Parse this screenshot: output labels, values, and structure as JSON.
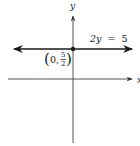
{
  "figure": {
    "type": "coordinate-graph",
    "axes": {
      "x_label": "x",
      "y_label": "y",
      "axis_color": "#555555"
    },
    "line": {
      "equation": "2y = 5",
      "equation_parts": {
        "lhs": "2y",
        "eq": "=",
        "rhs": "5"
      },
      "slope": 0,
      "y_value": 2.5,
      "color": "#1a1a1a"
    },
    "point": {
      "label_open": "(",
      "x": "0",
      "separator": ",",
      "y_numerator": "5",
      "y_denominator": "2",
      "label_close": ")",
      "coords": [
        0,
        2.5
      ]
    }
  }
}
